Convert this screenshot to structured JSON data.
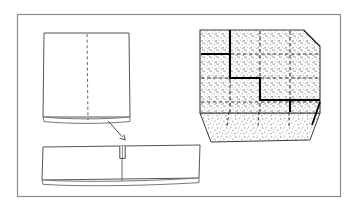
{
  "document": {
    "title": "Sheet folding and grid block technical illustration",
    "background_color": "#ffffff",
    "width": 357,
    "height": 209
  },
  "frame": {
    "name": "outer-border",
    "stroke_color": "#8a8a8a",
    "stroke_width": 1.2,
    "x": 17,
    "y": 14,
    "width": 323,
    "height": 182
  },
  "figures": [
    {
      "id": "flat-sheet",
      "label": "Unfolded square sheet with center fold line",
      "stroke_color": "#555555",
      "fill_color": "#ffffff",
      "outline": "44,33 129,33 130,117 43,117",
      "thickness_edge": "43,117 130,117 130,122 44,122",
      "fold_line": {
        "name": "center-fold-dashed-line",
        "x1": 87,
        "y1": 34,
        "x2": 88,
        "y2": 120,
        "dash": "3,2.6",
        "stroke_color": "#666666"
      }
    },
    {
      "id": "folded-bar",
      "label": "Folded flat bar with central slot",
      "stroke_color": "#555555",
      "fill_color": "#ffffff",
      "outline": "43,147 200,145 199,178 42,180",
      "thickness_edge": "42,180 199,178 199,183 43,184",
      "slot": {
        "name": "center-slot",
        "x": 120,
        "y": 146,
        "width": 5,
        "height": 12,
        "stroke_color": "#4a4a4a"
      },
      "seam_line": {
        "name": "center-seam-line",
        "x1": 122,
        "y1": 158,
        "x2": 122,
        "y2": 181,
        "stroke_color": "#5a5a5a"
      }
    },
    {
      "id": "process-arrow",
      "label": "Fold direction arrow",
      "stroke_color": "#4a4a4a",
      "x1": 108,
      "y1": 121,
      "x2": 124,
      "y2": 139,
      "head_size": 5
    },
    {
      "id": "grid-block",
      "label": "Stippled isometric block with dashed grid and bold staircase path",
      "stroke_color": "#3a3a3a",
      "stipple_color": "#9a9a9a",
      "top_face": "200,30 304,30 320,46 320,113 200,113",
      "front_face": "200,113 320,113 310,140 211,142",
      "bevel_corner": "304,30 320,46",
      "dashed_grid": {
        "stroke_color": "#2f2f2f",
        "dash": "3.4,2.6",
        "verticals": [
          230,
          260,
          290
        ],
        "horizontals": [
          54,
          78,
          102
        ],
        "v_top": 31,
        "v_bottom": 112,
        "h_left": 201,
        "h_right": 319
      },
      "front_face_ticks": [
        230,
        260,
        290
      ],
      "staircase_path": {
        "name": "bold-staircase-line",
        "stroke_color": "#000000",
        "stroke_width": 2.1,
        "points": "230,30 230,54 200,54 200,54 230,54 230,78 260,78 260,102 290,102 290,113 320,113"
      },
      "staircase_path_simple": "230,30 230,54 230,54 260,54 260,78 260,78 290,78 290,102 290,102 320,102",
      "side_drop": "320,102 312,125"
    }
  ],
  "annotations": {
    "figure_caption": "",
    "notes": []
  },
  "colors": {
    "ink": "#3a3a3a",
    "ink_bold": "#000000",
    "border": "#8a8a8a",
    "stipple": "#9a9a9a",
    "paper": "#ffffff"
  }
}
